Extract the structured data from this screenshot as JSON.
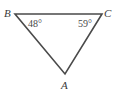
{
  "figure": {
    "type": "triangle",
    "stroke_color": "#4a4a4a",
    "background": "#ffffff",
    "vertices": {
      "B": {
        "label": "B",
        "x": 15,
        "y": 14
      },
      "C": {
        "label": "C",
        "x": 102,
        "y": 14
      },
      "A": {
        "label": "A",
        "x": 65,
        "y": 74
      }
    },
    "angles": {
      "B": {
        "label": "48°",
        "value": 48
      },
      "C": {
        "label": "59°",
        "value": 59
      }
    }
  }
}
